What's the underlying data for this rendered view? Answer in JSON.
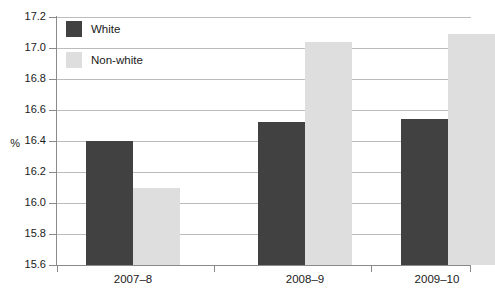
{
  "chart_data": {
    "type": "bar",
    "title": "",
    "subtitle": "",
    "xlabel": "",
    "ylabel": "%",
    "categories": [
      "2007–8",
      "2008–9",
      "2009–10"
    ],
    "series": [
      {
        "name": "White",
        "color": "#414141",
        "values": [
          16.4,
          16.52,
          16.54
        ]
      },
      {
        "name": "Non-white",
        "color": "#dedede",
        "values": [
          16.1,
          17.04,
          17.09
        ]
      }
    ],
    "ylim": [
      15.6,
      17.2
    ],
    "ytick_step": 0.2,
    "ytick_labels": [
      "17.2",
      "17.0",
      "16.8",
      "16.6",
      "16.4",
      "16.2",
      "16.0",
      "15.8",
      "15.6"
    ],
    "ytick_values": [
      17.2,
      17.0,
      16.8,
      16.6,
      16.4,
      16.2,
      16.0,
      15.8,
      15.6
    ],
    "grid": true,
    "grid_color": "#bcbcbc",
    "axis_color": "#8a8a8a",
    "legend_position": "top-left-inside",
    "legend": [
      {
        "label": "White",
        "color": "#414141"
      },
      {
        "label": "Non-white",
        "color": "#dedede"
      }
    ],
    "background": "#ffffff"
  }
}
